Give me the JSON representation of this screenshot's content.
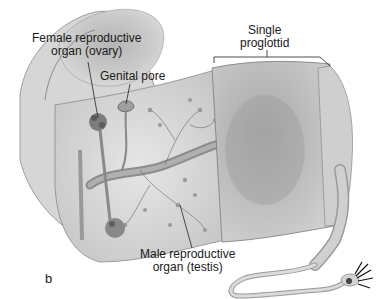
{
  "figure": {
    "panel_letter": "b",
    "labels": {
      "ovary_line1": "Female reproductive",
      "ovary_line2": "organ (ovary)",
      "genital_pore": "Genital pore",
      "proglottid_line1": "Single",
      "proglottid_line2": "proglottid",
      "testis_line1": "Male reproductive",
      "testis_line2": "organ (testis)"
    }
  }
}
